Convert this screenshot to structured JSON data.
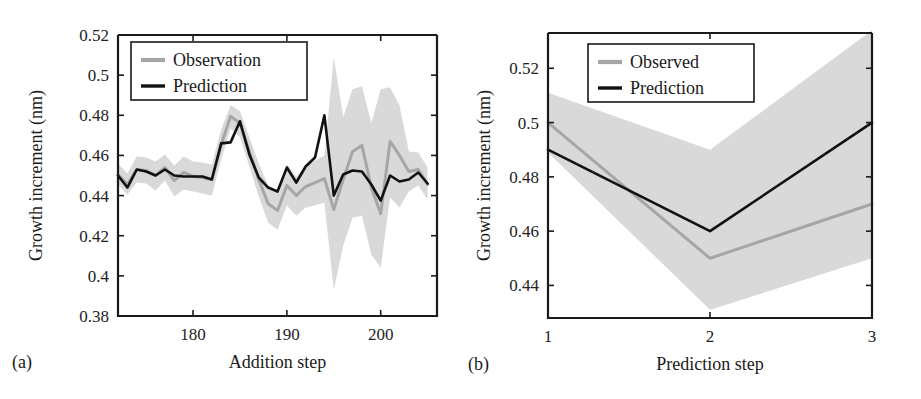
{
  "figure": {
    "background": "#ffffff",
    "colors": {
      "observation": "#a6a6a6",
      "prediction": "#111111",
      "band": "#d9d9d9",
      "axis": "#1a1a1a"
    }
  },
  "panels": [
    {
      "tag": "(a)",
      "chart_data": {
        "type": "line",
        "title": "",
        "xlabel": "Addition step",
        "ylabel": "Growth increment (nm)",
        "xlim": [
          172,
          206
        ],
        "ylim": [
          0.38,
          0.52
        ],
        "xticks": [
          180,
          190,
          200
        ],
        "xticklabels": [
          "180",
          "190",
          "200"
        ],
        "yticks": [
          0.38,
          0.4,
          0.42,
          0.44,
          0.46,
          0.48,
          0.5,
          0.52
        ],
        "yticklabels": [
          "0.38",
          "0.4",
          "0.42",
          "0.44",
          "0.46",
          "0.48",
          "0.5",
          "0.52"
        ],
        "grid": false,
        "legend_position": "top-left",
        "legend": [
          "Observation",
          "Prediction"
        ],
        "x": [
          172,
          173,
          174,
          175,
          176,
          177,
          178,
          179,
          180,
          181,
          182,
          183,
          184,
          185,
          186,
          187,
          188,
          189,
          190,
          191,
          192,
          193,
          194,
          195,
          196,
          197,
          198,
          199,
          200,
          201,
          202,
          203,
          204,
          205
        ],
        "series": [
          {
            "name": "Observation",
            "color": "#a6a6a6",
            "values": [
              0.4505,
              0.4455,
              0.453,
              0.4525,
              0.45,
              0.454,
              0.4475,
              0.4515,
              0.4495,
              0.449,
              0.448,
              0.4655,
              0.4795,
              0.476,
              0.462,
              0.448,
              0.436,
              0.4325,
              0.445,
              0.44,
              0.4445,
              0.4465,
              0.4485,
              0.433,
              0.448,
              0.462,
              0.465,
              0.444,
              0.431,
              0.467,
              0.46,
              0.452,
              0.453,
              0.4455
            ],
            "band_lower": [
              0.4455,
              0.4405,
              0.4465,
              0.446,
              0.4425,
              0.4475,
              0.4395,
              0.443,
              0.442,
              0.441,
              0.44,
              0.458,
              0.4735,
              0.469,
              0.4545,
              0.4395,
              0.4265,
              0.423,
              0.435,
              0.43,
              0.434,
              0.435,
              0.4365,
              0.393,
              0.415,
              0.429,
              0.43,
              0.4105,
              0.404,
              0.439,
              0.434,
              0.442,
              0.445,
              0.438
            ],
            "band_upper": [
              0.456,
              0.451,
              0.4595,
              0.459,
              0.457,
              0.4605,
              0.455,
              0.4595,
              0.457,
              0.4565,
              0.4555,
              0.473,
              0.485,
              0.482,
              0.469,
              0.456,
              0.445,
              0.442,
              0.4555,
              0.4495,
              0.4545,
              0.4575,
              0.46,
              0.509,
              0.479,
              0.493,
              0.4945,
              0.476,
              0.493,
              0.494,
              0.485,
              0.462,
              0.4615,
              0.454
            ]
          },
          {
            "name": "Prediction",
            "color": "#111111",
            "values": [
              0.45,
              0.444,
              0.453,
              0.452,
              0.45,
              0.453,
              0.45,
              0.4495,
              0.4495,
              0.4495,
              0.448,
              0.466,
              0.4665,
              0.477,
              0.4605,
              0.449,
              0.444,
              0.442,
              0.454,
              0.4465,
              0.4545,
              0.459,
              0.48,
              0.44,
              0.4505,
              0.4525,
              0.452,
              0.4455,
              0.4375,
              0.45,
              0.447,
              0.448,
              0.4515,
              0.446
            ]
          }
        ]
      }
    },
    {
      "tag": "(b)",
      "chart_data": {
        "type": "line",
        "title": "",
        "xlabel": "Prediction step",
        "ylabel": "Growth increment (nm)",
        "xlim": [
          1,
          3
        ],
        "ylim": [
          0.428,
          0.533
        ],
        "xticks": [
          1,
          2,
          3
        ],
        "xticklabels": [
          "1",
          "2",
          "3"
        ],
        "yticks": [
          0.44,
          0.46,
          0.48,
          0.5,
          0.52
        ],
        "yticklabels": [
          "0.44",
          "0.46",
          "0.48",
          "0.5",
          "0.52"
        ],
        "grid": false,
        "legend_position": "top-center",
        "legend": [
          "Observed",
          "Prediction"
        ],
        "x": [
          1,
          2,
          3
        ],
        "series": [
          {
            "name": "Observed",
            "color": "#a6a6a6",
            "values": [
              0.5,
              0.45,
              0.47
            ],
            "band_lower": [
              0.489,
              0.431,
              0.45
            ],
            "band_upper": [
              0.511,
              0.49,
              0.534
            ]
          },
          {
            "name": "Prediction",
            "color": "#111111",
            "values": [
              0.49,
              0.46,
              0.5
            ]
          }
        ]
      }
    }
  ]
}
